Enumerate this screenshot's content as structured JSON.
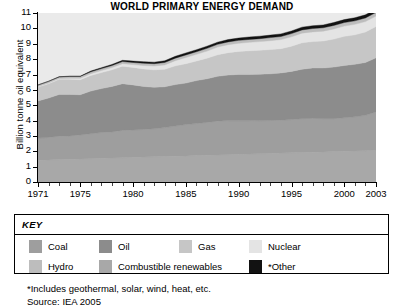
{
  "chart_data": {
    "type": "area",
    "title": "WORLD PRIMARY ENERGY DEMAND",
    "xlabel": "",
    "ylabel": "Billion tonne oil equivalent",
    "ylim": [
      0,
      11
    ],
    "xlim": [
      1971,
      2003
    ],
    "ytick_labels": [
      "0",
      "1",
      "2",
      "3",
      "4",
      "5",
      "6",
      "7",
      "8",
      "9",
      "10",
      "11"
    ],
    "ytick_values": [
      0,
      1,
      2,
      3,
      4,
      5,
      6,
      7,
      8,
      9,
      10,
      11
    ],
    "xtick_labels": [
      "1971",
      "1975",
      "1980",
      "1985",
      "1990",
      "1995",
      "2000",
      "2003"
    ],
    "xtick_values": [
      1971,
      1975,
      1980,
      1985,
      1990,
      1995,
      2000,
      2003
    ],
    "grid": false,
    "stacked": true,
    "legend_position": "below",
    "x": [
      1971,
      1972,
      1973,
      1974,
      1975,
      1976,
      1977,
      1978,
      1979,
      1980,
      1981,
      1982,
      1983,
      1984,
      1985,
      1986,
      1987,
      1988,
      1989,
      1990,
      1991,
      1992,
      1993,
      1994,
      1995,
      1996,
      1997,
      1998,
      1999,
      2000,
      2001,
      2002,
      2003
    ],
    "series": [
      {
        "name": "Combustible renewables",
        "color": "#a8a8a8",
        "values": [
          1.42,
          1.44,
          1.46,
          1.48,
          1.5,
          1.52,
          1.54,
          1.56,
          1.58,
          1.6,
          1.62,
          1.64,
          1.66,
          1.68,
          1.7,
          1.72,
          1.74,
          1.76,
          1.78,
          1.8,
          1.82,
          1.84,
          1.86,
          1.88,
          1.9,
          1.92,
          1.94,
          1.96,
          1.98,
          2.0,
          2.02,
          2.04,
          2.06
        ]
      },
      {
        "name": "Coal",
        "color": "#9e9e9e",
        "values": [
          1.44,
          1.46,
          1.52,
          1.52,
          1.56,
          1.62,
          1.68,
          1.7,
          1.78,
          1.78,
          1.8,
          1.82,
          1.88,
          1.96,
          2.04,
          2.08,
          2.14,
          2.2,
          2.22,
          2.2,
          2.18,
          2.14,
          2.14,
          2.14,
          2.16,
          2.2,
          2.2,
          2.16,
          2.14,
          2.18,
          2.22,
          2.3,
          2.5
        ]
      },
      {
        "name": "Oil",
        "color": "#8c8c8c",
        "values": [
          2.42,
          2.56,
          2.72,
          2.7,
          2.62,
          2.78,
          2.86,
          2.96,
          3.04,
          2.94,
          2.8,
          2.7,
          2.66,
          2.7,
          2.7,
          2.8,
          2.84,
          2.92,
          2.96,
          3.0,
          3.0,
          3.04,
          3.04,
          3.08,
          3.14,
          3.22,
          3.28,
          3.3,
          3.36,
          3.4,
          3.42,
          3.44,
          3.52
        ]
      },
      {
        "name": "Gas",
        "color": "#c6c6c6",
        "values": [
          0.9,
          0.94,
          0.98,
          0.98,
          0.98,
          1.02,
          1.04,
          1.08,
          1.14,
          1.14,
          1.14,
          1.14,
          1.14,
          1.22,
          1.26,
          1.28,
          1.34,
          1.4,
          1.46,
          1.5,
          1.54,
          1.56,
          1.58,
          1.58,
          1.64,
          1.72,
          1.72,
          1.76,
          1.82,
          1.9,
          1.92,
          1.98,
          2.04
        ]
      },
      {
        "name": "Nuclear",
        "color": "#e4e4e4",
        "values": [
          0.03,
          0.04,
          0.05,
          0.07,
          0.09,
          0.11,
          0.13,
          0.15,
          0.16,
          0.18,
          0.22,
          0.25,
          0.28,
          0.34,
          0.4,
          0.43,
          0.46,
          0.5,
          0.52,
          0.53,
          0.55,
          0.56,
          0.58,
          0.59,
          0.61,
          0.63,
          0.63,
          0.64,
          0.66,
          0.67,
          0.68,
          0.68,
          0.68
        ]
      },
      {
        "name": "Hydro",
        "color": "#bdbdbd",
        "values": [
          0.1,
          0.11,
          0.11,
          0.12,
          0.12,
          0.12,
          0.13,
          0.13,
          0.14,
          0.14,
          0.15,
          0.15,
          0.16,
          0.16,
          0.17,
          0.17,
          0.18,
          0.18,
          0.18,
          0.19,
          0.19,
          0.19,
          0.2,
          0.2,
          0.21,
          0.21,
          0.22,
          0.22,
          0.23,
          0.23,
          0.23,
          0.24,
          0.24
        ]
      },
      {
        "name": "*Other",
        "color": "#121212",
        "values": [
          0.01,
          0.01,
          0.01,
          0.02,
          0.02,
          0.05,
          0.06,
          0.07,
          0.08,
          0.09,
          0.1,
          0.1,
          0.11,
          0.12,
          0.13,
          0.13,
          0.14,
          0.14,
          0.15,
          0.15,
          0.16,
          0.16,
          0.16,
          0.17,
          0.17,
          0.18,
          0.18,
          0.18,
          0.19,
          0.19,
          0.2,
          0.2,
          0.21
        ]
      }
    ],
    "plot_background": "#eaeaea"
  },
  "legend": {
    "title": "KEY",
    "row1": [
      {
        "label": "Coal",
        "color": "#9e9e9e"
      },
      {
        "label": "Oil",
        "color": "#8c8c8c"
      },
      {
        "label": "Gas",
        "color": "#c6c6c6"
      },
      {
        "label": "Nuclear",
        "color": "#e4e4e4"
      }
    ],
    "row2": [
      {
        "label": "Hydro",
        "color": "#bdbdbd"
      },
      {
        "label": "Combustible renewables",
        "color": "#a8a8a8"
      },
      {
        "label": "*Other",
        "color": "#121212"
      }
    ]
  },
  "footnotes": {
    "line1": "*Includes geothermal, solar, wind, heat, etc.",
    "line2": "Source: IEA 2005"
  }
}
